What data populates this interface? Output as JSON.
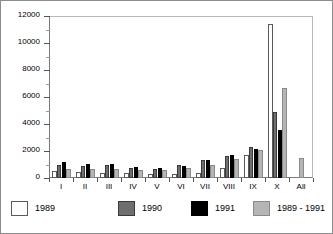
{
  "chart_data": {
    "type": "bar",
    "title": "",
    "subtitle": "",
    "xlabel": "",
    "ylabel": "",
    "ylim": [
      0,
      12000
    ],
    "ytick_step": 2000,
    "yticks": [
      0,
      2000,
      4000,
      6000,
      8000,
      10000,
      12000
    ],
    "ytick_labels": [
      "0",
      "2000",
      "4000",
      "6000",
      "8000",
      "10000",
      "12000"
    ],
    "minor_ticks": true,
    "grid": false,
    "legend_position": "bottom",
    "categories": [
      "I",
      "II",
      "III",
      "IV",
      "V",
      "VI",
      "VII",
      "VIII",
      "IX",
      "X",
      "All"
    ],
    "series": [
      {
        "name": "1989",
        "color": "#ffffff",
        "values": [
          500,
          450,
          400,
          350,
          300,
          300,
          400,
          750,
          1700,
          11400,
          null
        ]
      },
      {
        "name": "1990",
        "color": "#6f6f6f",
        "values": [
          950,
          900,
          1000,
          750,
          700,
          950,
          1300,
          1650,
          2300,
          4900,
          null
        ]
      },
      {
        "name": "1991",
        "color": "#000000",
        "values": [
          1150,
          1050,
          1050,
          800,
          750,
          900,
          1300,
          1700,
          2150,
          3550,
          null
        ]
      },
      {
        "name": "1989 - 1991",
        "color": "#b5b5b5",
        "values": [
          700,
          650,
          680,
          600,
          620,
          750,
          1000,
          1400,
          2100,
          6650,
          1500
        ]
      }
    ]
  },
  "legend": {
    "entries": [
      {
        "label": "1989"
      },
      {
        "label": "1990"
      },
      {
        "label": "1991"
      },
      {
        "label": "1989 - 1991"
      }
    ]
  }
}
